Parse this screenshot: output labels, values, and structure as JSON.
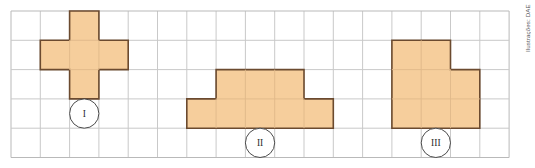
{
  "canvas": {
    "width": 535,
    "height": 168,
    "background": "#ffffff"
  },
  "credit": {
    "text": "Ilustrações: DAE",
    "color": "#55585c"
  },
  "grid": {
    "origin_x": 11,
    "origin_y": 11,
    "cell": 29.3,
    "cols": 17,
    "rows": 5,
    "line_color": "#c9c9c9",
    "border_color": "#b9b9b9",
    "line_width": 1
  },
  "style": {
    "fill": "#f6ce9c",
    "stroke": "#6b4a2f",
    "stroke_width": 1.6,
    "inner_line_color": "#e0b98a",
    "label_circle_stroke": "#4a4a4a",
    "label_circle_fill": "#ffffff",
    "label_text_color": "#2b2b2b"
  },
  "chart_data": {
    "type": "diagram",
    "title": "",
    "subtitle": "",
    "grid": {
      "cols": 17,
      "rows": 5,
      "cell_units": 1
    },
    "figures": [
      {
        "id": "I",
        "label": "I",
        "name": "cross-pentomino",
        "cell_count": 5,
        "cells": [
          [
            2,
            0
          ],
          [
            1,
            1
          ],
          [
            2,
            1
          ],
          [
            3,
            1
          ],
          [
            2,
            2
          ]
        ],
        "outline": [
          [
            2,
            0
          ],
          [
            3,
            0
          ],
          [
            3,
            1
          ],
          [
            4,
            1
          ],
          [
            4,
            2
          ],
          [
            3,
            2
          ],
          [
            3,
            3
          ],
          [
            2,
            3
          ],
          [
            2,
            2
          ],
          [
            1,
            2
          ],
          [
            1,
            1
          ],
          [
            2,
            1
          ]
        ],
        "label_cell": [
          2,
          3
        ]
      },
      {
        "id": "II",
        "label": "II",
        "name": "stepped-octomino",
        "cell_count": 8,
        "cells": [
          [
            7,
            2
          ],
          [
            8,
            2
          ],
          [
            9,
            2
          ],
          [
            6,
            3
          ],
          [
            7,
            3
          ],
          [
            8,
            3
          ],
          [
            9,
            3
          ],
          [
            10,
            3
          ]
        ],
        "outline": [
          [
            7,
            2
          ],
          [
            10,
            2
          ],
          [
            10,
            3
          ],
          [
            11,
            3
          ],
          [
            11,
            4
          ],
          [
            6,
            4
          ],
          [
            6,
            3
          ],
          [
            7,
            3
          ]
        ],
        "label_cell": [
          8,
          4
        ]
      },
      {
        "id": "III",
        "label": "III",
        "name": "square-minus-corner-octomino",
        "cell_count": 8,
        "cells": [
          [
            13,
            1
          ],
          [
            14,
            1
          ],
          [
            13,
            2
          ],
          [
            14,
            2
          ],
          [
            15,
            2
          ],
          [
            13,
            3
          ],
          [
            14,
            3
          ],
          [
            15,
            3
          ]
        ],
        "outline": [
          [
            13,
            1
          ],
          [
            15,
            1
          ],
          [
            15,
            2
          ],
          [
            16,
            2
          ],
          [
            16,
            4
          ],
          [
            13,
            4
          ]
        ],
        "label_cell": [
          14,
          4
        ]
      }
    ]
  }
}
